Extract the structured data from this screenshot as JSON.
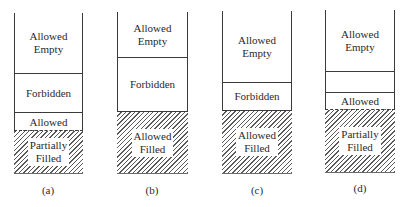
{
  "figure": {
    "panels": [
      {
        "caption": "(a)",
        "segments": [
          {
            "label": "Allowed\nEmpty",
            "kind": "empty"
          },
          {
            "label": "Forbidden",
            "kind": "forbidden"
          },
          {
            "label": "Allowed",
            "kind": "allowed"
          },
          {
            "label": "Partially\nFilled",
            "kind": "filled-partial"
          }
        ]
      },
      {
        "caption": "(b)",
        "segments": [
          {
            "label": "Allowed\nEmpty",
            "kind": "empty"
          },
          {
            "label": "Forbidden",
            "kind": "forbidden"
          },
          {
            "label": "Allowed\nFilled",
            "kind": "filled"
          }
        ]
      },
      {
        "caption": "(c)",
        "segments": [
          {
            "label": "Allowed\nEmpty",
            "kind": "empty"
          },
          {
            "label": "Forbidden",
            "kind": "forbidden"
          },
          {
            "label": "Allowed\nFilled",
            "kind": "filled"
          }
        ]
      },
      {
        "caption": "(d)",
        "segments": [
          {
            "label": "Allowed\nEmpty",
            "kind": "empty"
          },
          {
            "label": "",
            "kind": "forbidden"
          },
          {
            "label": "Allowed",
            "kind": "allowed"
          },
          {
            "label": "Partially\nFilled",
            "kind": "filled-partial"
          }
        ]
      }
    ]
  }
}
